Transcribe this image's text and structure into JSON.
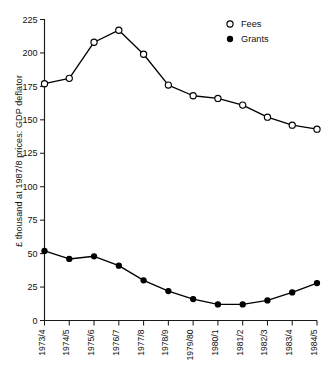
{
  "chart_data": {
    "type": "line",
    "title": "",
    "xlabel": "",
    "ylabel": "£ thousand at 1987/8 prices: GDP deflator",
    "categories": [
      "1973/4",
      "1974/5",
      "1975/6",
      "1976/7",
      "1977/8",
      "1978/9",
      "1979/80",
      "1980/1",
      "1981/2",
      "1982/3",
      "1983/4",
      "1984/5"
    ],
    "series": [
      {
        "name": "Fees",
        "marker": "open-circle",
        "color": "#000000",
        "values": [
          177,
          181,
          208,
          217,
          199,
          176,
          168,
          166,
          161,
          152,
          146,
          143
        ]
      },
      {
        "name": "Grants",
        "marker": "filled-circle",
        "color": "#000000",
        "values": [
          52,
          46,
          48,
          41,
          30,
          22,
          16,
          12,
          12,
          15,
          21,
          28
        ]
      }
    ],
    "ylim": [
      0,
      225
    ],
    "yticks": [
      0,
      25,
      50,
      75,
      100,
      125,
      150,
      175,
      200,
      225
    ],
    "ytick_labels": [
      "0",
      "25",
      "50",
      "75",
      "100",
      "125",
      "150",
      "175",
      "200",
      "225"
    ],
    "grid": false,
    "legend_position": "top-right"
  },
  "legend": {
    "entries": [
      {
        "label": "Fees",
        "marker": "open-circle"
      },
      {
        "label": "Grants",
        "marker": "filled-circle"
      }
    ]
  }
}
